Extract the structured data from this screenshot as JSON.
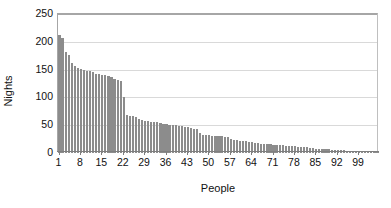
{
  "chart_data": {
    "type": "bar",
    "title": "",
    "xlabel": "People",
    "ylabel": "Nights",
    "xlim": [
      0,
      105
    ],
    "ylim": [
      0,
      250
    ],
    "ytick_labels": [
      "0",
      "50",
      "100",
      "150",
      "200",
      "250"
    ],
    "ytick_values": [
      0,
      50,
      100,
      150,
      200,
      250
    ],
    "xtick_labels": [
      "1",
      "8",
      "15",
      "22",
      "29",
      "36",
      "43",
      "50",
      "57",
      "64",
      "71",
      "78",
      "85",
      "92",
      "99"
    ],
    "xtick_values": [
      1,
      8,
      15,
      22,
      29,
      36,
      43,
      50,
      57,
      64,
      71,
      78,
      85,
      92,
      99
    ],
    "grid": true,
    "legend": false,
    "bar_color": "#8c8c8c",
    "gridline_color": "#d9d9d9",
    "axis_color": "#7f7f7f",
    "categories": [
      1,
      2,
      3,
      4,
      5,
      6,
      7,
      8,
      9,
      10,
      11,
      12,
      13,
      14,
      15,
      16,
      17,
      18,
      19,
      20,
      21,
      22,
      23,
      24,
      25,
      26,
      27,
      28,
      29,
      30,
      31,
      32,
      33,
      34,
      35,
      36,
      37,
      38,
      39,
      40,
      41,
      42,
      43,
      44,
      45,
      46,
      47,
      48,
      49,
      50,
      51,
      52,
      53,
      54,
      55,
      56,
      57,
      58,
      59,
      60,
      61,
      62,
      63,
      64,
      65,
      66,
      67,
      68,
      69,
      70,
      71,
      72,
      73,
      74,
      75,
      76,
      77,
      78,
      79,
      80,
      81,
      82,
      83,
      84,
      85,
      86,
      87,
      88,
      89,
      90,
      91,
      92,
      93,
      94,
      95,
      96,
      97,
      98,
      99,
      100,
      101,
      102,
      103,
      104,
      105
    ],
    "values": [
      212,
      206,
      181,
      176,
      161,
      156,
      153,
      151,
      150,
      148,
      147,
      145,
      143,
      142,
      141,
      140,
      139,
      137,
      133,
      132,
      130,
      100,
      68,
      67,
      66,
      64,
      62,
      60,
      58,
      57,
      56,
      56,
      55,
      54,
      53,
      52,
      51,
      50,
      50,
      49,
      48,
      47,
      46,
      45,
      44,
      43,
      36,
      33,
      32,
      32,
      31,
      31,
      30,
      30,
      29,
      29,
      25,
      24,
      23,
      22,
      22,
      21,
      20,
      19,
      18,
      18,
      17,
      17,
      16,
      16,
      15,
      15,
      14,
      14,
      13,
      13,
      12,
      12,
      11,
      11,
      10,
      10,
      9,
      9,
      8,
      8,
      8,
      7,
      7,
      6,
      6,
      5,
      5,
      5,
      4,
      4,
      4,
      3,
      3,
      3,
      2,
      2,
      2,
      1,
      1
    ]
  },
  "axis": {
    "y_title": "Nights",
    "x_title": "People"
  }
}
